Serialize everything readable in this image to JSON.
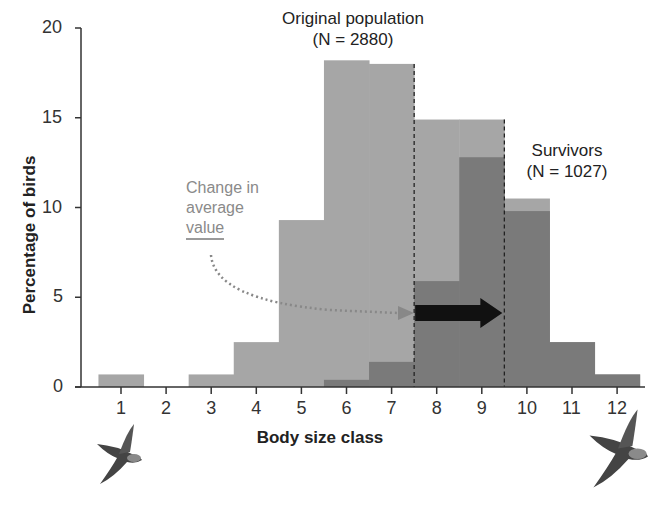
{
  "chart_data": {
    "type": "bar",
    "title": "",
    "xlabel": "Body size class",
    "ylabel": "Percentage of birds",
    "ylim": [
      0,
      20
    ],
    "yticks": [
      0,
      5,
      10,
      15,
      20
    ],
    "categories": [
      "1",
      "2",
      "3",
      "4",
      "5",
      "6",
      "7",
      "8",
      "9",
      "10",
      "11",
      "12"
    ],
    "series": [
      {
        "name": "Original population (N = 2880)",
        "color": "#a6a6a6",
        "values": [
          0.7,
          0,
          0.7,
          2.5,
          9.3,
          18.2,
          18.0,
          14.9,
          14.9,
          10.5,
          2.5,
          0.7
        ]
      },
      {
        "name": "Survivors (N = 1027)",
        "color": "#7a7a7a",
        "values": [
          0,
          0,
          0,
          0,
          0,
          0.4,
          1.4,
          5.9,
          12.8,
          9.8,
          2.5,
          0.7
        ]
      }
    ],
    "mean_lines": {
      "original": 7.5,
      "survivors": 9.5
    },
    "annotations": [
      "Original population (N = 2880)",
      "Survivors (N = 1027)",
      "Change in average value"
    ],
    "grid": false,
    "legend": "inline annotations"
  },
  "labels": {
    "original_title": "Original population",
    "original_n": "(N = 2880)",
    "survivors_title": "Survivors",
    "survivors_n": "(N = 1027)",
    "change_line1": "Change in",
    "change_line2": "average",
    "change_line3": "value",
    "xlabel": "Body size class",
    "ylabel": "Percentage of birds"
  },
  "icons": {
    "left": "small-bird-icon",
    "right": "large-bird-icon"
  }
}
